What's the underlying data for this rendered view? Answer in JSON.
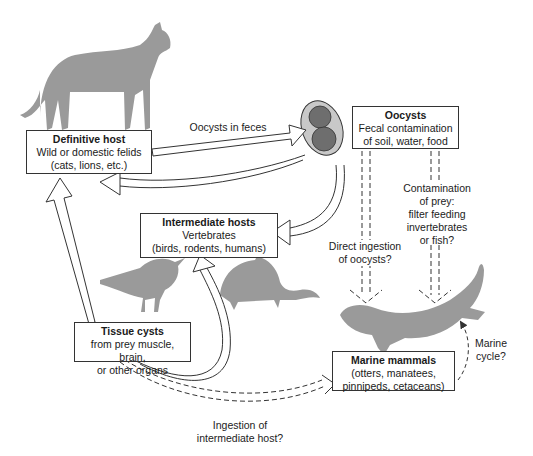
{
  "nodes": {
    "definitive_host": {
      "title": "Definitive host",
      "line1": "Wild or domestic felids",
      "line2": "(cats, lions, etc.)"
    },
    "oocysts": {
      "title": "Oocysts",
      "line1": "Fecal contamination",
      "line2": "of soil, water, food"
    },
    "intermediate_hosts": {
      "title": "Intermediate hosts",
      "line1": "Vertebrates",
      "line2": "(birds, rodents, humans)"
    },
    "tissue_cysts": {
      "title": "Tissue cysts",
      "line1": "from prey muscle, brain,",
      "line2": "or other organs"
    },
    "marine_mammals": {
      "title": "Marine mammals",
      "line1": "(otters, manatees,",
      "line2": "pinnipeds, cetaceans)"
    }
  },
  "edge_labels": {
    "oocysts_in_feces": "Oocysts in feces",
    "contamination_prey": [
      "Contamination",
      "of prey:",
      "filter feeding",
      "invertebrates",
      "or fish?"
    ],
    "direct_ingestion": [
      "Direct ingestion",
      "of oocysts?"
    ],
    "marine_cycle": [
      "Marine",
      "cycle?"
    ],
    "ingestion_intermediate": [
      "Ingestion of",
      "intermediate host?"
    ]
  },
  "colors": {
    "silhouette": "#9a9a9a",
    "oocyst_outer": "#c8c8c8",
    "oocyst_inner": "#6e6e6e",
    "line": "#333333"
  }
}
